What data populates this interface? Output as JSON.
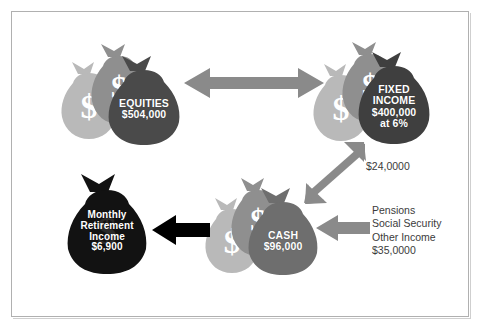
{
  "diagram": {
    "title_visible": false,
    "background": "#ffffff",
    "frame_color": "#b0b0b0",
    "palette": {
      "bag_light": "#b9b9b9",
      "bag_mid": "#8f8f8f",
      "bag_dark": "#4a4a4a",
      "bag_black": "#121212",
      "arrow_gray": "#8a8a8a",
      "arrow_black": "#000000",
      "label_text": "#ffffff",
      "note_text": "#3b3b3b"
    }
  },
  "nodes": {
    "equities": {
      "name": "EQUITIES",
      "label": "EQUITIES\n$504,000",
      "amount": "$504,000",
      "front_bag_color": "#4a4a4a",
      "bag_count": 3
    },
    "fixed_income": {
      "name": "FIXED INCOME",
      "label": "FIXED\nINCOME\n$400,000\nat 6%",
      "amount": "$400,000",
      "rate": "at 6%",
      "front_bag_color": "#3f3f3f",
      "bag_count": 3
    },
    "cash": {
      "name": "CASH",
      "label": "CASH\n$96,000",
      "amount": "$96,000",
      "front_bag_color": "#6e6e6e",
      "bag_count": 3
    },
    "retirement_income": {
      "name": "Monthly Retirement Income",
      "label": "Monthly\nRetirement\nIncome\n$6,900",
      "amount": "$6,900",
      "front_bag_color": "#121212",
      "bag_count": 1
    }
  },
  "connectors": {
    "equities_fixed_income": {
      "type": "double-headed-horizontal-arrow",
      "color": "#8a8a8a",
      "label": ""
    },
    "fixed_income_to_cash": {
      "type": "diagonal-arrow-down-left",
      "color": "#8a8a8a",
      "label": "$24,0000"
    },
    "income_to_cash": {
      "type": "horizontal-arrow-left",
      "color": "#8a8a8a",
      "label": "Pensions\nSocial Security\nOther Income\n$35,0000"
    },
    "cash_to_retirement": {
      "type": "horizontal-arrow-left",
      "color": "#000000",
      "label": ""
    }
  },
  "annotations": {
    "interest_income": "$24,0000",
    "other_income_block": "Pensions\nSocial Security\nOther Income\n$35,0000",
    "other_income_amount": "$35,0000",
    "dollar_glyph": "$"
  }
}
